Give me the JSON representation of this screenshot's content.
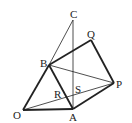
{
  "diagram": {
    "type": "geometry",
    "colors": {
      "stroke": "#222222",
      "background": "#ffffff"
    },
    "points": {
      "O": {
        "label": "O",
        "x": 23,
        "y": 110
      },
      "A": {
        "label": "A",
        "x": 73,
        "y": 109
      },
      "B": {
        "label": "B",
        "x": 49,
        "y": 65
      },
      "C": {
        "label": "C",
        "x": 73,
        "y": 20
      },
      "Q": {
        "label": "Q",
        "x": 91,
        "y": 40
      },
      "P": {
        "label": "P",
        "x": 114,
        "y": 83
      },
      "R": {
        "label": "R"
      },
      "S": {
        "label": "S"
      }
    },
    "thick_segments": [
      "OA",
      "OB",
      "BA",
      "BQ",
      "QP",
      "AP"
    ],
    "thin_segments": [
      "BC",
      "AC",
      "BP",
      "OP"
    ]
  }
}
